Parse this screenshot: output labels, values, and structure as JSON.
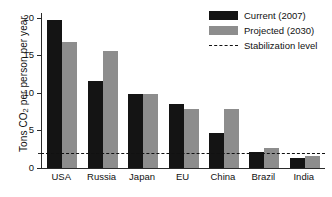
{
  "chart_data": {
    "type": "bar",
    "title": "",
    "xlabel": "",
    "ylabel": "Tons CO2 per person per year",
    "ylabel_prefix": "Tons CO",
    "ylabel_sub": "2",
    "ylabel_suffix": " per person per year",
    "categories": [
      "USA",
      "Russia",
      "Japan",
      "EU",
      "China",
      "Brazil",
      "India"
    ],
    "series": [
      {
        "name": "Current (2007)",
        "color": "#141414",
        "values": [
          19.7,
          11.5,
          9.8,
          8.5,
          4.7,
          2.1,
          1.3
        ]
      },
      {
        "name": "Projected (2030)",
        "color": "#8d8d8d",
        "values": [
          16.8,
          15.6,
          9.8,
          7.9,
          7.9,
          2.6,
          1.6
        ]
      }
    ],
    "annotations": [
      {
        "name": "Stabilization level",
        "type": "hline",
        "value": 2.0,
        "style": "dashed",
        "color": "#111111"
      }
    ],
    "ylim": [
      0,
      20.6
    ],
    "yticks": [
      0,
      5,
      10,
      15,
      20
    ],
    "ytick_labels": [
      "0",
      "5",
      "10",
      "15",
      "20"
    ],
    "yminor_ticks": [
      2.0
    ],
    "grid": false,
    "legend_position": "top-right"
  },
  "legend": {
    "entries": [
      {
        "label": "Current (2007)",
        "marker": "swatch",
        "color": "#141414"
      },
      {
        "label": "Projected (2030)",
        "marker": "swatch",
        "color": "#8d8d8d"
      },
      {
        "label": "Stabilization level",
        "marker": "dashed-line",
        "color": "#111111"
      }
    ]
  }
}
